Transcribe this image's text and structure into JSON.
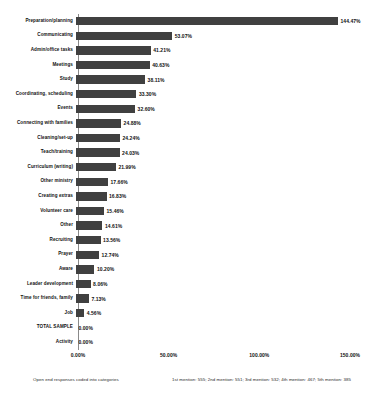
{
  "chart_data": {
    "type": "bar",
    "orientation": "horizontal",
    "title": "",
    "xlabel": "",
    "ylabel": "",
    "xlim": [
      0,
      150
    ],
    "grid": false,
    "legend": null,
    "bar_color": "#404040",
    "axis_color": "#8a8a8a",
    "value_suffix": "%",
    "xticks": [
      "0.00%",
      "50.00%",
      "100.00%",
      "150.00%"
    ],
    "xtick_values": [
      0,
      50,
      100,
      150
    ],
    "categories": [
      "Preparation/planning",
      "Communicating",
      "Admin/office tasks",
      "Meetings",
      "Study",
      "Coordinating, scheduling",
      "Events",
      "Connecting with families",
      "Cleaning/set-up",
      "Teach/training",
      "Curriculum (writing)",
      "Other ministry",
      "Creating extras",
      "Volunteer care",
      "Other",
      "Recruiting",
      "Prayer",
      "Aware",
      "Leader development",
      "Time for friends, family",
      "Job",
      "TOTAL SAMPLE",
      "Activity"
    ],
    "values": [
      144.47,
      53.07,
      41.21,
      40.63,
      38.11,
      33.3,
      32.6,
      24.88,
      24.24,
      24.03,
      21.99,
      17.66,
      16.83,
      15.46,
      14.61,
      13.56,
      12.74,
      10.2,
      8.06,
      7.13,
      4.56,
      0.0,
      0.0
    ],
    "value_labels": [
      "144.47%",
      "53.07%",
      "41.21%",
      "40.63%",
      "38.11%",
      "33.30%",
      "32.60%",
      "24.88%",
      "24.24%",
      "24.03%",
      "21.99%",
      "17.66%",
      "16.83%",
      "15.46%",
      "14.61%",
      "13.56%",
      "12.74%",
      "10.20%",
      "8.06%",
      "7.13%",
      "4.56%",
      "0.00%",
      "0.00%"
    ]
  },
  "footnotes": {
    "left": "Open end responses coded into categories",
    "right": "1st mention: 555; 2nd mention: 551; 3rd mention: 532; 4th mention: 467; 5th mention: 385"
  }
}
